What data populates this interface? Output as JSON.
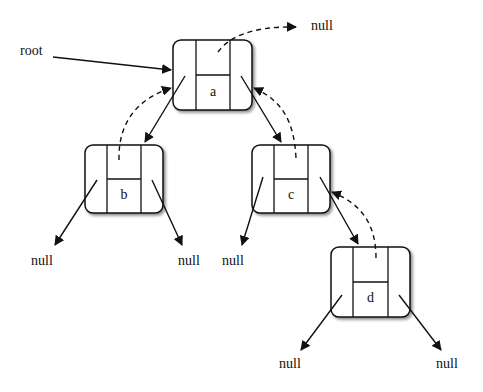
{
  "diagram": {
    "type": "binary-tree-with-parent-pointers",
    "root_label": "root",
    "null_label": "null",
    "nodes": [
      {
        "id": "a",
        "label": "a",
        "x": 173,
        "y": 40,
        "w": 79,
        "h": 70
      },
      {
        "id": "b",
        "label": "b",
        "x": 85,
        "y": 145,
        "w": 78,
        "h": 68
      },
      {
        "id": "c",
        "label": "c",
        "x": 252,
        "y": 145,
        "w": 78,
        "h": 68
      },
      {
        "id": "d",
        "label": "d",
        "x": 331,
        "y": 247,
        "w": 79,
        "h": 70
      }
    ],
    "edges": [
      {
        "from": "root",
        "to": "a",
        "kind": "pointer"
      },
      {
        "from": "a",
        "to": "b",
        "kind": "left-child"
      },
      {
        "from": "a",
        "to": "c",
        "kind": "right-child"
      },
      {
        "from": "c",
        "to": "d",
        "kind": "right-child"
      },
      {
        "from": "a",
        "to": "null",
        "kind": "parent",
        "style": "dashed"
      },
      {
        "from": "b",
        "to": "a",
        "kind": "parent",
        "style": "dashed"
      },
      {
        "from": "c",
        "to": "a",
        "kind": "parent",
        "style": "dashed"
      },
      {
        "from": "d",
        "to": "c",
        "kind": "parent",
        "style": "dashed"
      },
      {
        "from": "b",
        "to": "null",
        "kind": "left-child"
      },
      {
        "from": "b",
        "to": "null",
        "kind": "right-child"
      },
      {
        "from": "c",
        "to": "null",
        "kind": "left-child"
      },
      {
        "from": "d",
        "to": "null",
        "kind": "left-child"
      },
      {
        "from": "d",
        "to": "null",
        "kind": "right-child"
      }
    ],
    "labels": {
      "root": "root",
      "null_a_parent": "null",
      "null_b_left": "null",
      "null_b_right": "null",
      "null_c_left": "null",
      "null_d_left": "null",
      "null_d_right": "null"
    }
  }
}
